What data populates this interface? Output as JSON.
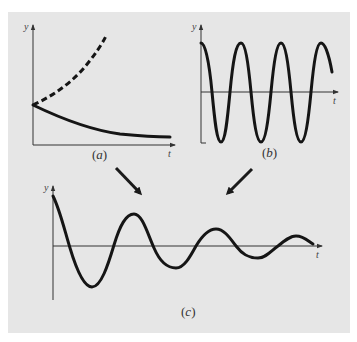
{
  "figure": {
    "background": "#e6e6e6",
    "curve_color": "#151515",
    "panels": [
      {
        "id": "a",
        "caption_open": "(",
        "caption_letter": "a",
        "caption_close": ")",
        "y_axis_label": "y",
        "x_axis_label": "t",
        "description": "Exponential growth (dashed) and exponential decay (solid) from a common starting value"
      },
      {
        "id": "b",
        "caption_open": "(",
        "caption_letter": "b",
        "caption_close": ")",
        "y_axis_label": "y",
        "x_axis_label": "t",
        "description": "Undamped sinusoidal oscillation"
      },
      {
        "id": "c",
        "caption_open": "(",
        "caption_letter": "c",
        "caption_close": ")",
        "y_axis_label": "y",
        "x_axis_label": "t",
        "description": "Damped oscillation: product of decay (a) and sinusoid (b)"
      }
    ],
    "arrows": [
      {
        "from": "a",
        "to": "c"
      },
      {
        "from": "b",
        "to": "c"
      }
    ]
  }
}
